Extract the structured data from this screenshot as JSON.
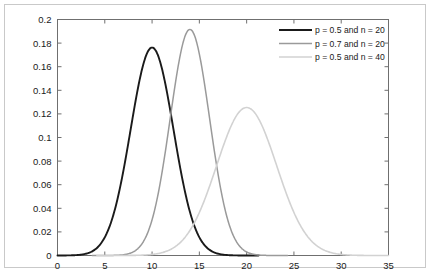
{
  "chart_data": {
    "type": "line",
    "title": "",
    "subtitle": "",
    "xlabel": "",
    "ylabel": "",
    "xlim": [
      0,
      35
    ],
    "ylim": [
      0,
      0.2
    ],
    "grid": false,
    "legend_position": "top-right",
    "xticks": [
      "0",
      "5",
      "10",
      "15",
      "20",
      "25",
      "30",
      "35"
    ],
    "xtick_values": [
      0,
      5,
      10,
      15,
      20,
      25,
      30,
      35
    ],
    "yticks": [
      "0",
      "0.02",
      "0.04",
      "0.06",
      "0.08",
      "0.1",
      "0.12",
      "0.14",
      "0.16",
      "0.18",
      "0.2"
    ],
    "ytick_values": [
      0,
      0.02,
      0.04,
      0.06,
      0.08,
      0.1,
      0.12,
      0.14,
      0.16,
      0.18,
      0.2
    ],
    "series": [
      {
        "name": "p = 0.5 and n = 20",
        "color": "#1a1a1a",
        "width": 1.9,
        "peak_x": 10,
        "peak_y": 0.1762,
        "x": [
          0,
          1,
          2,
          3,
          4,
          5,
          6,
          7,
          8,
          9,
          10,
          11,
          12,
          13,
          14,
          15,
          16,
          17,
          18,
          19,
          20
        ],
        "values": [
          1e-06,
          1.9e-05,
          0.000181,
          0.001087,
          0.004621,
          0.014786,
          0.036964,
          0.073929,
          0.120134,
          0.160179,
          0.176197,
          0.160179,
          0.120134,
          0.073929,
          0.036964,
          0.014786,
          0.004621,
          0.001087,
          0.000181,
          1.9e-05,
          1e-06
        ]
      },
      {
        "name": "p = 0.7 and n = 20",
        "color": "#9a9a9a",
        "width": 1.5,
        "peak_x": 14,
        "peak_y": 0.1916,
        "x": [
          0,
          1,
          2,
          3,
          4,
          5,
          6,
          7,
          8,
          9,
          10,
          11,
          12,
          13,
          14,
          15,
          16,
          17,
          18,
          19,
          20
        ],
        "values": [
          0.0,
          0.0,
          0.0,
          0.0,
          2e-07,
          2.2e-06,
          2.18e-05,
          0.0001582,
          0.0008656,
          0.0036564,
          0.011998,
          0.030852,
          0.0653831,
          0.1143703,
          0.1642304,
          0.1788631,
          0.130421,
          0.0716121,
          0.027838,
          0.0683726,
          0.0007979
        ]
      },
      {
        "name": "p = 0.5 and n = 40",
        "color": "#d2d2d2",
        "width": 1.6,
        "peak_x": 20,
        "peak_y": 0.1254,
        "x": [
          8,
          10,
          12,
          14,
          16,
          18,
          20,
          22,
          24,
          26,
          28,
          30,
          32
        ],
        "values": [
          0.0001,
          0.0011,
          0.0074,
          0.0311,
          0.0773,
          0.1194,
          0.1254,
          0.1194,
          0.0773,
          0.0311,
          0.0074,
          0.0011,
          0.0001
        ]
      }
    ],
    "legend_entries": [
      {
        "label": "p = 0.5 and n = 20",
        "color": "#1a1a1a"
      },
      {
        "label": "p = 0.7 and n = 20",
        "color": "#9a9a9a"
      },
      {
        "label": "p = 0.5 and n = 40",
        "color": "#d2d2d2"
      }
    ]
  }
}
